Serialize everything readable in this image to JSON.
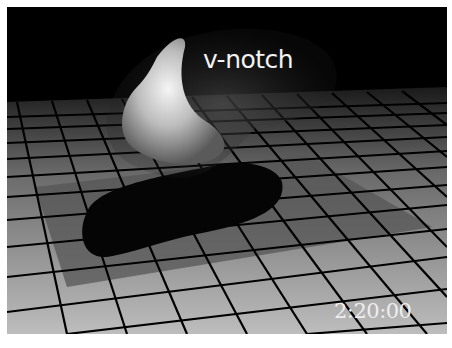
{
  "scene": {
    "label": "v-notch",
    "timestamp": "2:20:00",
    "description": "Grayscale 3D rendering of a translucent biological structure over a perspective grid floor with a dark shadow",
    "colors": {
      "background": "#000000",
      "floor_tile": "#b0b0b0",
      "grid_line": "#000000",
      "text": "#f0f0f0"
    }
  }
}
